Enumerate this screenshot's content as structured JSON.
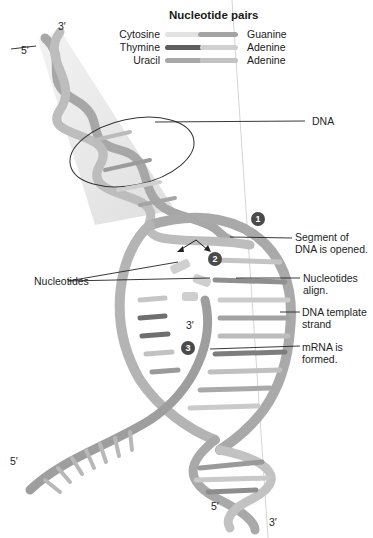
{
  "legend": {
    "title": "Nucleotide pairs",
    "pairs": [
      {
        "left": "Cytosine",
        "right": "Guanine",
        "left_color": "#d8d8d8",
        "right_color": "#9a9a9a"
      },
      {
        "left": "Thymine",
        "right": "Adenine",
        "left_color": "#5e5e5e",
        "right_color": "#c8c8c8"
      },
      {
        "left": "Uracil",
        "right": "Adenine",
        "left_color": "#a8a8a8",
        "right_color": "#b8b8b8"
      }
    ]
  },
  "labels": {
    "dna": "DNA",
    "step1": "Segment of\nDNA is opened.",
    "step1_line1": "Segment of",
    "step1_line2": "DNA is opened.",
    "nucleotides": "Nucleotides",
    "step2_line1": "Nucleotides",
    "step2_line2": "align.",
    "template_line1": "DNA template",
    "template_line2": "strand",
    "step3_line1": "mRNA is",
    "step3_line2": "formed."
  },
  "badges": [
    "1",
    "2",
    "3"
  ],
  "ends": {
    "top_3": "3′",
    "top_5": "5′",
    "mrna_3": "3′",
    "left_5": "5′",
    "bottom_5": "5′",
    "bottom_3": "3′"
  }
}
